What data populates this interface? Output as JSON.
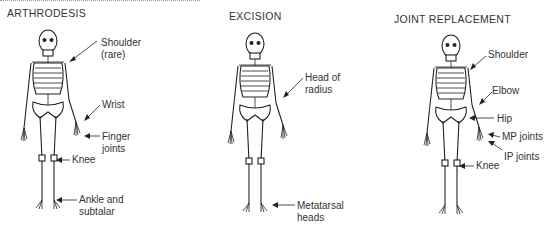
{
  "panels": [
    {
      "title": "ARTHRODESIS",
      "labels": [
        {
          "text": "Shoulder\n(rare)"
        },
        {
          "text": "Wrist"
        },
        {
          "text": "Finger\njoints"
        },
        {
          "text": "Knee"
        },
        {
          "text": "Ankle and\nsubtalar"
        }
      ]
    },
    {
      "title": "EXCISION",
      "labels": [
        {
          "text": "Head of\nradius"
        },
        {
          "text": "Metatarsal\nheads"
        }
      ]
    },
    {
      "title": "JOINT REPLACEMENT",
      "labels": [
        {
          "text": "Shoulder"
        },
        {
          "text": "Elbow"
        },
        {
          "text": "Hip"
        },
        {
          "text": "MP joints"
        },
        {
          "text": "IP joints"
        },
        {
          "text": "Knee"
        }
      ]
    }
  ]
}
